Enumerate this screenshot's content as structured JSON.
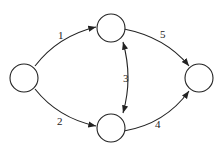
{
  "diagram": {
    "type": "directed-graph",
    "nodes": [
      {
        "id": "left",
        "label": ""
      },
      {
        "id": "top",
        "label": ""
      },
      {
        "id": "bottom",
        "label": ""
      },
      {
        "id": "right",
        "label": ""
      }
    ],
    "edges": [
      {
        "from": "left",
        "to": "top",
        "label": "1"
      },
      {
        "from": "left",
        "to": "bottom",
        "label": "2"
      },
      {
        "from": "top",
        "to": "bottom",
        "label": "3",
        "bidirectional": true
      },
      {
        "from": "bottom",
        "to": "right",
        "label": "4"
      },
      {
        "from": "top",
        "to": "right",
        "label": "5"
      }
    ]
  }
}
